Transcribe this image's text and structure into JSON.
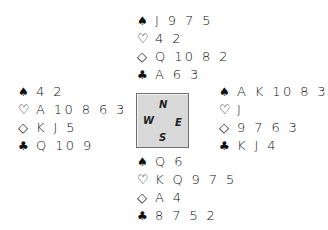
{
  "suits": {
    "spades": "♠",
    "hearts": "♡",
    "diamonds": "◇",
    "clubs": "♣"
  },
  "compass": {
    "north": "N",
    "west": "W",
    "east": "E",
    "south": "S",
    "background": "#d9d9d9"
  },
  "hands": {
    "north": {
      "spades": "J 9 7 5",
      "hearts": "4 2",
      "diamonds": "Q 10 8 2",
      "clubs": "A 6 3"
    },
    "west": {
      "spades": "4 2",
      "hearts": "A 10 8 6 3",
      "diamonds": "K J 5",
      "clubs": "Q 10 9"
    },
    "east": {
      "spades": "A K 10 8 3",
      "hearts": "J",
      "diamonds": "9 7 6 3",
      "clubs": "K J 4"
    },
    "south": {
      "spades": "Q 6",
      "hearts": "K Q 9 7 5",
      "diamonds": "A 4",
      "clubs": "8 7 5 2"
    }
  }
}
